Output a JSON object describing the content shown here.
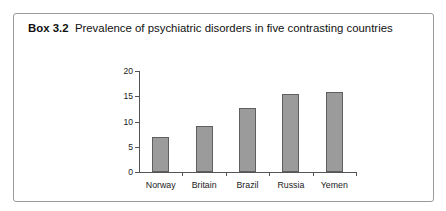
{
  "box": {
    "label": "Box 3.2",
    "caption": "Prevalence of psychiatric disorders in five contrasting countries"
  },
  "chart_data": {
    "type": "bar",
    "title": "Prevalence of psychiatric disorders in five contrasting countries",
    "xlabel": "",
    "ylabel": "",
    "categories": [
      "Norway",
      "Britain",
      "Brazil",
      "Russia",
      "Yemen"
    ],
    "values": [
      7.0,
      9.2,
      12.6,
      15.4,
      15.9
    ],
    "ylim": [
      0,
      20
    ],
    "yticks": [
      0,
      5,
      10,
      15,
      20
    ],
    "ytick_labels": [
      "0",
      "5",
      "10",
      "15",
      "20"
    ],
    "grid": false,
    "legend": false,
    "bar_color": "#9b9b9b",
    "bar_edge_color": "#5f5f5f",
    "axis_color": "#555555"
  }
}
